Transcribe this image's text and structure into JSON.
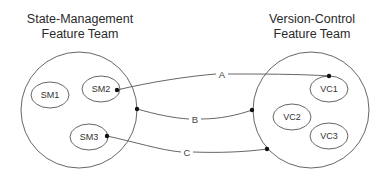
{
  "diagram": {
    "teams": [
      {
        "title_line1": "State-Management",
        "title_line2": "Feature Team",
        "circle": {
          "cx": 79,
          "cy": 110,
          "r": 58
        },
        "members": [
          {
            "label": "SM1",
            "cx": 50,
            "cy": 95,
            "rx": 19,
            "ry": 13
          },
          {
            "label": "SM2",
            "cx": 101,
            "cy": 89,
            "rx": 19,
            "ry": 13
          },
          {
            "label": "SM3",
            "cx": 89,
            "cy": 137,
            "rx": 19,
            "ry": 13
          }
        ]
      },
      {
        "title_line1": "Version-Control",
        "title_line2": "Feature Team",
        "circle": {
          "cx": 311,
          "cy": 110,
          "r": 58
        },
        "members": [
          {
            "label": "VC1",
            "cx": 329,
            "cy": 89,
            "rx": 19,
            "ry": 13
          },
          {
            "label": "VC2",
            "cx": 292,
            "cy": 117,
            "rx": 19,
            "ry": 13
          },
          {
            "label": "VC3",
            "cx": 329,
            "cy": 136,
            "rx": 19,
            "ry": 13
          }
        ]
      }
    ],
    "connections": [
      {
        "label": "A",
        "from": "SM2",
        "to": "VC1"
      },
      {
        "label": "B",
        "from": "State-Management Feature Team",
        "to": "Version-Control Feature Team"
      },
      {
        "label": "C",
        "from": "SM3",
        "to": "Version-Control Feature Team"
      }
    ],
    "colors": {
      "stroke": "#555555",
      "dot": "#111111",
      "text": "#2a2a2a",
      "background": "#ffffff"
    }
  }
}
